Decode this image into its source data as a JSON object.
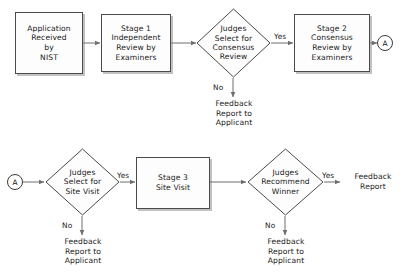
{
  "diagram": {
    "colors": {
      "box_border": "#4a4a4a",
      "box_fill": "#fdfdfd",
      "line": "#6e6e6e",
      "text": "#1a1a1a",
      "shadow": "rgba(120,120,120,0.45)"
    },
    "nodes": {
      "application_received": {
        "label": "Application\nReceived\nby\nNIST",
        "shape": "rectangle"
      },
      "stage1": {
        "label": "Stage 1\nIndependent\nReview by\nExaminers",
        "shape": "rectangle"
      },
      "decision_consensus": {
        "label": "Judges\nSelect for\nConsensus\nReview",
        "shape": "diamond"
      },
      "stage2": {
        "label": "Stage 2\nConsensus\nReview by\nExaminers",
        "shape": "rectangle"
      },
      "connector_a_out": {
        "label": "A",
        "shape": "circle"
      },
      "connector_a_in": {
        "label": "A",
        "shape": "circle"
      },
      "decision_site_visit": {
        "label": "Judges\nSelect for\nSite Visit",
        "shape": "diamond"
      },
      "stage3": {
        "label": "Stage 3\nSite Visit",
        "shape": "rectangle"
      },
      "decision_winner": {
        "label": "Judges\nRecommend\nWinner",
        "shape": "diamond"
      },
      "feedback_consensus_no": {
        "label": "Feedback\nReport to\nApplicant",
        "shape": "text"
      },
      "feedback_site_visit_no": {
        "label": "Feedback\nReport to\nApplicant",
        "shape": "text"
      },
      "feedback_winner_no": {
        "label": "Feedback\nReport to\nApplicant",
        "shape": "text"
      },
      "feedback_winner_yes": {
        "label": "Feedback\nReport",
        "shape": "text"
      }
    },
    "edge_labels": {
      "consensus_yes": "Yes",
      "consensus_no": "No",
      "site_visit_yes": "Yes",
      "site_visit_no": "No",
      "winner_yes": "Yes",
      "winner_no": "No"
    }
  }
}
